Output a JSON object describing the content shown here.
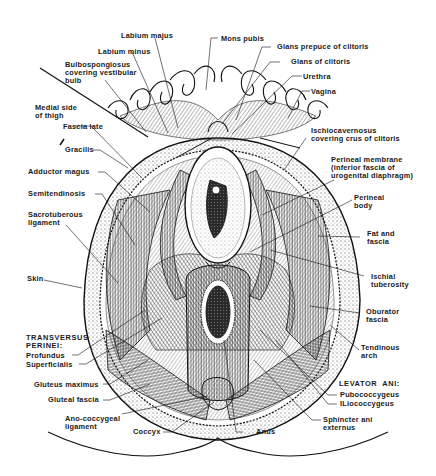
{
  "figure": {
    "labels": {
      "labium_majus": "Labium majus",
      "mons_pubis": "Mons pubis",
      "labium_minus": "Labium minus",
      "glans_prepuce": "Glans prepuce of clitoris",
      "bulbospongiosus": "Bulbospongiosus\ncovering vestibular\nbulb",
      "glans_clitoris": "Glans of clitoris",
      "urethra": "Urethra",
      "medial_thigh": "Medial side\nof thigh",
      "vagina": "Vagina",
      "fascia_late": "Fascia late",
      "ischiocavernosus": "Ischiocavernosus\ncovering crus of clitoris",
      "gracilis": "Gracilis",
      "perineal_membrane": "Perineal membrane\n(inferior fascia of\nurogenital diaphragm)",
      "adductor_magus": "Adductor magus",
      "semitendinosis": "Semitendinosis",
      "perineal_body": "Perineal\nbody",
      "sacrotuberous": "Sacrotuberous\nligament",
      "fat_fascia": "Fat and\nfascia",
      "skin": "Skin",
      "ischial_tuberosity": "Ischial\ntuberosity",
      "obturator_fascia": "Oburator\nfascia",
      "transversus_perinei": "TRANSVERSUS\nPERINEI:",
      "profundus": "Profundus",
      "superficialis": "Superficialis",
      "tendinous_arch": "Tendinous\narch",
      "gluteus_maximus": "Gluteus maximus",
      "levator_ani": "LEVATOR  ANI:",
      "gluteal_fascia": "Gluteal fascia",
      "pubococcygeus": "Pubococcygeus",
      "iliococcygeus": "ILiococcygeus",
      "ano_coccygeal": "Ano-coccygeal\nligament",
      "sphincter_ani": "Sphincter ani\nexternus",
      "coccyx": "Coccyx",
      "anus": "Anus"
    },
    "colors": {
      "ink": "#1a1a1a",
      "paper": "#ffffff"
    }
  }
}
